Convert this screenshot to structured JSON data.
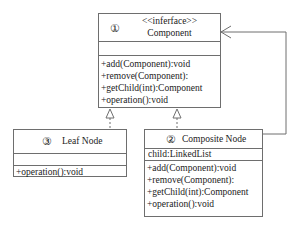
{
  "diagram": {
    "type": "uml-class",
    "pattern": "Composite",
    "colors": {
      "line": "#6e6e6e",
      "text": "#222222",
      "background": "#ffffff"
    },
    "classes": [
      {
        "id": "component",
        "number": "①",
        "stereotype": "<<inferface>>",
        "name": "Component",
        "attributes": [],
        "operations": [
          "+add(Component):void",
          "+remove(Component):",
          "+getChild(int):Component",
          "+operation():void"
        ]
      },
      {
        "id": "leaf",
        "number": "③",
        "name": "Leaf Node",
        "attributes": [],
        "operations": [
          "+operation():void"
        ]
      },
      {
        "id": "composite",
        "number": "②",
        "name": "Composite Node",
        "attributes": [
          "child:LinkedList"
        ],
        "operations": [
          "+add(Component):void",
          "+remove(Component):",
          "+getChild(int):Component",
          "+operation():void"
        ]
      }
    ],
    "relations": [
      {
        "from": "leaf",
        "to": "component",
        "type": "realization"
      },
      {
        "from": "composite",
        "to": "component",
        "type": "realization"
      },
      {
        "from": "composite",
        "to": "component",
        "type": "association",
        "arrow": "open"
      }
    ]
  }
}
